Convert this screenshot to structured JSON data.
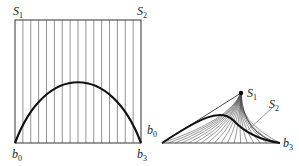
{
  "left_panel": {
    "labels": {
      "s1": "S",
      "s1_sub": "1",
      "s2": "S",
      "s2_sub": "2",
      "b0": "b",
      "b0_sub": "0",
      "b3": "b",
      "b3_sub": "3"
    },
    "frame": {
      "x0": 15,
      "y0": 20,
      "x1": 141,
      "y1": 143
    },
    "vertical_lines": 16,
    "curve": {
      "start": [
        15,
        143
      ],
      "control1": [
        45,
        62
      ],
      "control2": [
        111,
        62
      ],
      "end": [
        141,
        143
      ]
    }
  },
  "right_panel": {
    "labels": {
      "s1": "S",
      "s1_sub": "1",
      "s2": "S",
      "s2_sub": "2",
      "b0": "b",
      "b0_sub": "0",
      "b3": "b",
      "b3_sub": "3"
    },
    "apex": [
      241,
      93
    ],
    "baseline": {
      "x0": 162,
      "x1": 280,
      "y": 143
    },
    "fan_lines": 18,
    "s2_leader": {
      "from": [
        248,
        130
      ],
      "to": [
        272,
        108
      ]
    }
  },
  "colors": {
    "line": "#555555",
    "curve": "#111111",
    "frame": "#333333"
  }
}
